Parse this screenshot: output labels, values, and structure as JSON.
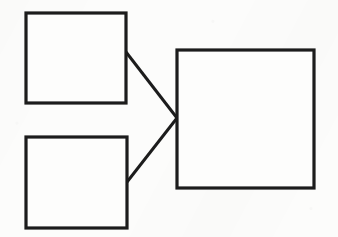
{
  "diagram": {
    "type": "block-diagram",
    "title": "",
    "background_color": "#fcfcfb",
    "stroke_color": "#1c1c1c",
    "fill_color": "#fdfdfc",
    "stroke_width": 3,
    "canvas": {
      "width": 338,
      "height": 237
    },
    "nodes": [
      {
        "id": "node-top-left",
        "label": "",
        "shape": "rectangle",
        "x": 26,
        "y": 13,
        "width": 100,
        "height": 90
      },
      {
        "id": "node-bottom-left",
        "label": "",
        "shape": "rectangle",
        "x": 26,
        "y": 137,
        "width": 101,
        "height": 91
      },
      {
        "id": "node-right",
        "label": "",
        "shape": "rectangle",
        "x": 177,
        "y": 50,
        "width": 137,
        "height": 138
      }
    ],
    "edges": [
      {
        "id": "edge-top-left-to-right",
        "from": "node-top-left",
        "to": "node-right",
        "label": "",
        "x1": 126,
        "y1": 52,
        "x2": 177,
        "y2": 118
      },
      {
        "id": "edge-bottom-left-to-right",
        "from": "node-bottom-left",
        "to": "node-right",
        "label": "",
        "x1": 127,
        "y1": 182,
        "x2": 177,
        "y2": 118
      }
    ]
  }
}
